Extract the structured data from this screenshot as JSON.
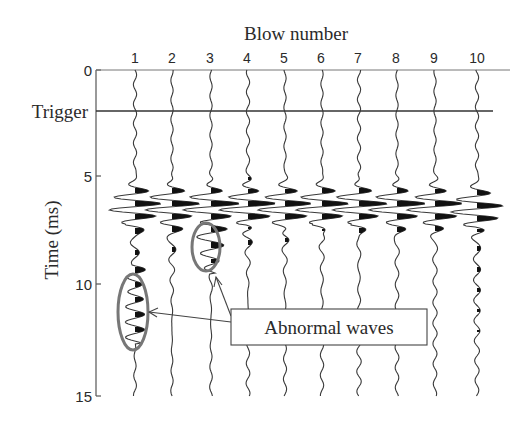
{
  "figure": {
    "xlabel": "Blow number",
    "ylabel": "Time (ms)",
    "trigger_label": "Trigger",
    "annotation": "Abnormal waves",
    "colors": {
      "ink": "#2a2a2a",
      "ellipse": "#777777",
      "background": "#ffffff"
    }
  },
  "chart_data": {
    "type": "line",
    "title": "",
    "xlabel": "Blow number",
    "ylabel": "Time (ms)",
    "x_ticks": [
      "1",
      "2",
      "3",
      "4",
      "5",
      "6",
      "7",
      "8",
      "9",
      "10"
    ],
    "y_ticks": [
      0,
      5,
      10,
      15
    ],
    "ylim": [
      0,
      15
    ],
    "y_inverted": true,
    "grid": false,
    "trigger_time_ms": 1.9,
    "series": [
      {
        "name": "Blow 1",
        "main_arrival_ms": 6.3,
        "abnormal": true,
        "abnormal_window_ms": [
          9.0,
          12.6
        ]
      },
      {
        "name": "Blow 2",
        "main_arrival_ms": 6.3,
        "abnormal": false
      },
      {
        "name": "Blow 3",
        "main_arrival_ms": 6.3,
        "abnormal": true,
        "abnormal_window_ms": [
          7.2,
          9.4
        ]
      },
      {
        "name": "Blow 4",
        "main_arrival_ms": 6.3,
        "abnormal": false
      },
      {
        "name": "Blow 5",
        "main_arrival_ms": 6.3,
        "abnormal": false
      },
      {
        "name": "Blow 6",
        "main_arrival_ms": 6.3,
        "abnormal": false
      },
      {
        "name": "Blow 7",
        "main_arrival_ms": 6.3,
        "abnormal": false
      },
      {
        "name": "Blow 8",
        "main_arrival_ms": 6.3,
        "abnormal": false
      },
      {
        "name": "Blow 9",
        "main_arrival_ms": 6.3,
        "abnormal": false
      },
      {
        "name": "Blow 10",
        "main_arrival_ms": 6.4,
        "abnormal": false
      }
    ],
    "annotations": [
      {
        "text": "Abnormal waves",
        "targets": [
          "Blow 1",
          "Blow 3"
        ]
      },
      {
        "text": "Trigger",
        "y_ms": 1.9
      }
    ]
  }
}
